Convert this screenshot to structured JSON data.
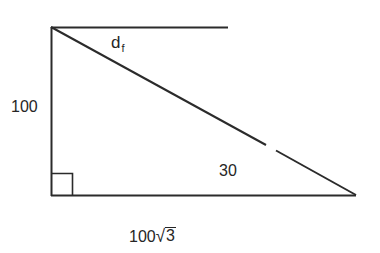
{
  "figure": {
    "type": "right-triangle-diagram",
    "colors": {
      "line": "#2b2b2b",
      "text": "#262626",
      "background": "#ffffff"
    },
    "vertices": {
      "top_left": [
        51,
        27
      ],
      "bottom_left": [
        51,
        195
      ],
      "bottom_right": [
        356,
        195
      ]
    },
    "top_extension_end": [
      228,
      27
    ],
    "hypotenuse_gap": {
      "from": [
        267,
        145
      ],
      "to": [
        275,
        150
      ]
    },
    "right_angle_marker": {
      "x": 51,
      "y": 173,
      "size": 21
    }
  },
  "labels": {
    "vertical_side": "100",
    "hypotenuse_main": "d",
    "hypotenuse_sub": "f",
    "angle": "30",
    "base_coefficient": "100",
    "base_sqrt_symbol": "√",
    "base_radicand": "3"
  }
}
